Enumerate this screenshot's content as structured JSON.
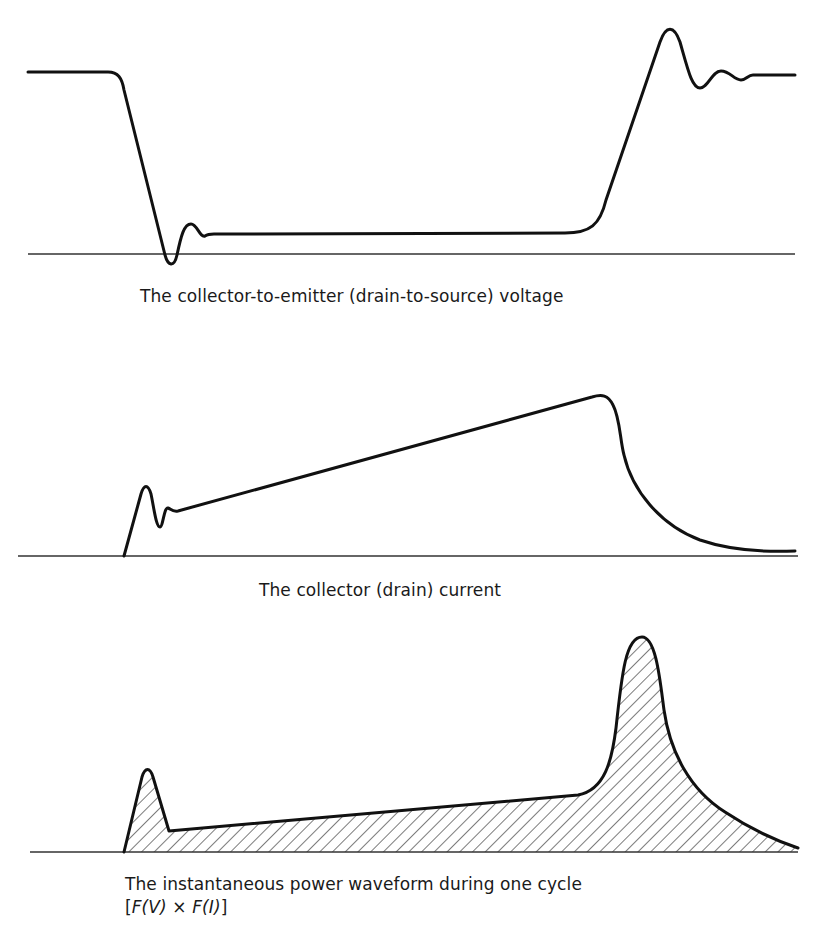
{
  "figure": {
    "panels": [
      {
        "id": "voltage",
        "caption": "The collector-to-emitter (drain-to-source) voltage",
        "baseline": {
          "x1": 28,
          "x2": 795,
          "y": 254
        },
        "waveform_path": "M28,72 L108,72 C118,72 122,78 124,90 L165,255 C168,266 174,268 177,255 C181,236 184,224 191,224 C197,224 200,238 205,236 C208,234 210,234 214,234 L565,233 C590,233 600,225 606,200 L660,42 C666,25 674,25 680,42 C688,70 692,88 700,88 C708,88 712,71 721,71 C730,71 734,80 741,80 C746,80 748,75 753,75 L795,75",
        "fill": false
      },
      {
        "id": "current",
        "caption": "The collector (drain) current",
        "baseline": {
          "x1": 18,
          "x2": 798,
          "y": 556
        },
        "waveform_path": "M124,556 L141,494 C144,484 148,484 151,494 C154,508 156,527 160,527 C163,527 164,507 168,508 C171,509 172,512 178,511 L592,397 C602,394 608,395 613,405 C620,418 620,440 624,455 C632,490 660,525 700,540 C735,552 770,552 795,551",
        "fill": false
      },
      {
        "id": "power",
        "caption": "The instantaneous power waveform during one cycle",
        "caption_formula": {
          "open": "[",
          "fv": "F(V)",
          "times": " × ",
          "fi": "F(I)",
          "close": "]"
        },
        "baseline": {
          "x1": 30,
          "x2": 798,
          "y": 852
        },
        "waveform_path": "M124,852 L142,777 C145,767 150,767 153,777 L169,831 L578,795 C605,790 612,760 616,728 C622,672 626,637 642,637 C656,637 660,680 664,710 C670,752 690,790 725,812 C755,832 780,842 798,848",
        "fill": true,
        "hatch": "diagonal"
      }
    ]
  },
  "style": {
    "stroke_color": "#111111",
    "baseline_color": "#333333",
    "hatch_color": "#222222",
    "background": "#ffffff"
  }
}
